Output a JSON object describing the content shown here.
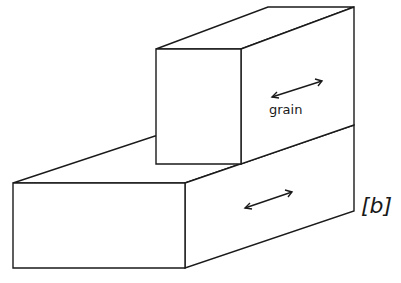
{
  "figure": {
    "panel_label": "[b]",
    "grain_label": "grain",
    "colors": {
      "line": "#1a1a1a",
      "background": "#ffffff"
    }
  }
}
